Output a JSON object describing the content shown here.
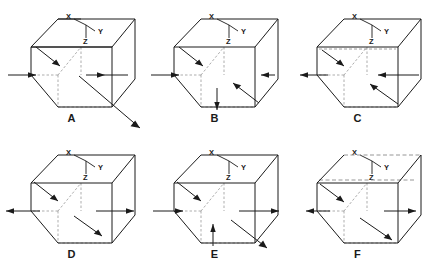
{
  "figure": {
    "type": "engineering-diagram",
    "axis_triad": {
      "x_label": "X",
      "y_label": "Y",
      "z_label": "Z"
    },
    "boxes": [
      {
        "label": "A",
        "arrows": [
          {
            "name": "left-face-arrow",
            "direction": "right",
            "type": "normal-inward-horizontal"
          },
          {
            "name": "right-face-arrow",
            "direction": "right",
            "type": "normal-outward-horizontal"
          },
          {
            "name": "top-face-arrow",
            "direction": "down-right",
            "type": "shear-diagonal"
          },
          {
            "name": "front-face-arrow",
            "direction": "down-right",
            "type": "shear-diagonal-external"
          }
        ]
      },
      {
        "label": "B",
        "arrows": [
          {
            "name": "left-face-arrow",
            "direction": "right",
            "type": "normal-inward-horizontal"
          },
          {
            "name": "top-face-arrow",
            "direction": "down-right",
            "type": "shear-diagonal"
          },
          {
            "name": "right-face-arrow",
            "direction": "left",
            "type": "shear-short"
          },
          {
            "name": "bottom-face-arrow",
            "direction": "down",
            "type": "normal-vertical"
          },
          {
            "name": "front-face-arrow",
            "direction": "down-right",
            "type": "shear-diagonal"
          }
        ]
      },
      {
        "label": "C",
        "arrows": [
          {
            "name": "left-face-arrow",
            "direction": "left",
            "type": "normal-inward-horizontal"
          },
          {
            "name": "right-face-arrow",
            "direction": "left",
            "type": "normal-inward-horizontal"
          },
          {
            "name": "top-face-arrow",
            "direction": "down-right",
            "type": "shear-diagonal"
          },
          {
            "name": "front-face-arrow",
            "direction": "up-left",
            "type": "shear-diagonal"
          }
        ]
      },
      {
        "label": "D",
        "arrows": [
          {
            "name": "left-face-arrow",
            "direction": "left",
            "type": "normal-outward-horizontal"
          },
          {
            "name": "right-face-arrow",
            "direction": "right",
            "type": "normal-outward-horizontal"
          },
          {
            "name": "top-face-arrow",
            "direction": "down-right",
            "type": "shear-diagonal"
          },
          {
            "name": "front-face-arrow",
            "direction": "down-right",
            "type": "shear-diagonal"
          }
        ]
      },
      {
        "label": "E",
        "arrows": [
          {
            "name": "left-face-arrow",
            "direction": "right",
            "type": "normal-inward-horizontal"
          },
          {
            "name": "right-face-arrow",
            "direction": "right",
            "type": "normal-outward-horizontal"
          },
          {
            "name": "top-face-arrow",
            "direction": "down-right",
            "type": "shear-diagonal"
          },
          {
            "name": "bottom-face-arrow",
            "direction": "up",
            "type": "normal-vertical"
          },
          {
            "name": "front-face-arrow",
            "direction": "down-right",
            "type": "shear-diagonal-external"
          }
        ]
      },
      {
        "label": "F",
        "arrows": [
          {
            "name": "left-face-arrow",
            "direction": "left",
            "type": "normal-inward-horizontal"
          },
          {
            "name": "right-face-arrow",
            "direction": "right",
            "type": "shear-short"
          },
          {
            "name": "top-face-arrow",
            "direction": "down-right",
            "type": "shear-diagonal"
          },
          {
            "name": "front-face-arrow",
            "direction": "down-right",
            "type": "shear-diagonal"
          }
        ]
      }
    ],
    "colors": {
      "line": "#1a1a1a",
      "hidden_line": "#7a7a7a",
      "background": "#ffffff"
    }
  }
}
